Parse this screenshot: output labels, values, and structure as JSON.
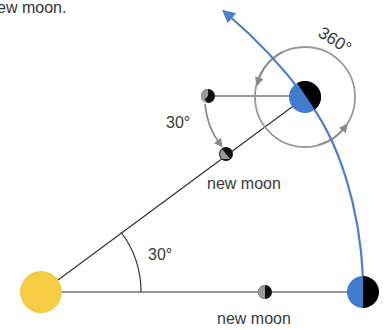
{
  "caption": "ew moon.",
  "labels": {
    "new_moon_top": "new moon",
    "new_moon_bottom": "new moon",
    "angle_small_top": "30°",
    "angle_sun": "30°",
    "rotation": "360°"
  },
  "colors": {
    "sun": "#f6cc45",
    "earth_day": "#3f7bcf",
    "earth_night": "#000000",
    "orbit": "#4a7fd0",
    "line": "#333333",
    "gray_arrow": "#8a8a8a",
    "background": "#ffffff"
  },
  "objects": [
    {
      "name": "sun",
      "cx": 41,
      "cy": 292,
      "r": 21
    },
    {
      "name": "earth-bottom",
      "cx": 363,
      "cy": 292,
      "r": 16
    },
    {
      "name": "earth-top",
      "cx": 305,
      "cy": 97,
      "r": 16
    },
    {
      "name": "moon-bottom",
      "cx": 265,
      "cy": 292,
      "r": 7
    },
    {
      "name": "moon-top-start",
      "cx": 208,
      "cy": 96,
      "r": 7
    },
    {
      "name": "moon-top-new",
      "cx": 226,
      "cy": 154,
      "r": 7
    }
  ]
}
